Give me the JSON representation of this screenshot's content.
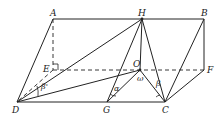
{
  "diagram": {
    "type": "geometry-3d-prism",
    "points": {
      "A": {
        "label": "A",
        "x": 53,
        "y": 19
      },
      "H": {
        "label": "H",
        "x": 142,
        "y": 19
      },
      "B": {
        "label": "B",
        "x": 204,
        "y": 19
      },
      "E": {
        "label": "E",
        "x": 53,
        "y": 70
      },
      "O": {
        "label": "O",
        "x": 140,
        "y": 70
      },
      "F": {
        "label": "F",
        "x": 204,
        "y": 70
      },
      "D": {
        "label": "D",
        "x": 17,
        "y": 102
      },
      "G": {
        "label": "G",
        "x": 107,
        "y": 102
      },
      "C": {
        "label": "C",
        "x": 165,
        "y": 102
      }
    },
    "solid_edges": [
      [
        "A",
        "B"
      ],
      [
        "A",
        "D"
      ],
      [
        "D",
        "C"
      ],
      [
        "B",
        "F"
      ],
      [
        "B",
        "C"
      ],
      [
        "F",
        "C"
      ],
      [
        "H",
        "D"
      ],
      [
        "H",
        "G"
      ],
      [
        "H",
        "C"
      ],
      [
        "H",
        "O"
      ],
      [
        "D",
        "O"
      ],
      [
        "O",
        "G"
      ],
      [
        "O",
        "C"
      ]
    ],
    "dashed_edges": [
      [
        "A",
        "E"
      ],
      [
        "E",
        "F"
      ],
      [
        "E",
        "D"
      ]
    ],
    "angles": [
      {
        "symbol": "β'",
        "vertex": "D",
        "label": "beta-prime"
      },
      {
        "symbol": "α",
        "vertex": "G",
        "label": "alpha"
      },
      {
        "symbol": "ω",
        "vertex": "O",
        "label": "omega"
      },
      {
        "symbol": "β",
        "vertex": "C",
        "label": "beta"
      }
    ]
  },
  "labels": {
    "A": "A",
    "H": "H",
    "B": "B",
    "E": "E",
    "O": "O",
    "F": "F",
    "D": "D",
    "G": "G",
    "C": "C",
    "beta_prime": "β'",
    "alpha": "α",
    "omega": "ω",
    "beta": "β"
  }
}
